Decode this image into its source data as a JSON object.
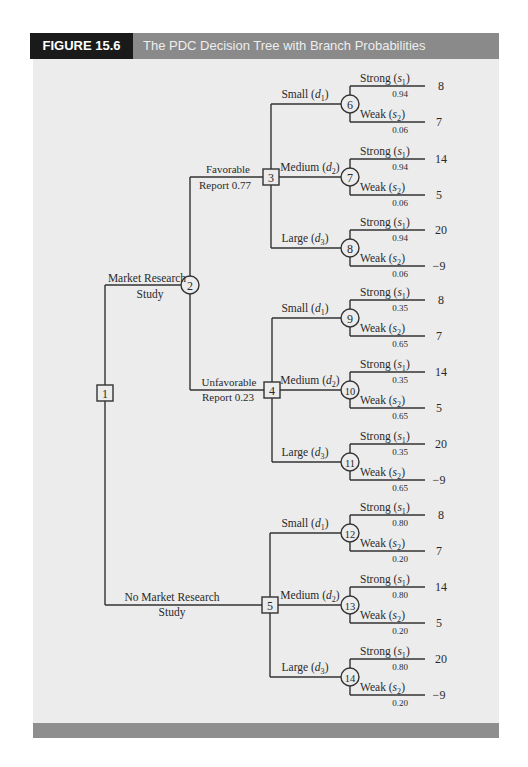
{
  "figure": {
    "label": "FIGURE 15.6",
    "title": "The PDC Decision Tree with Branch Probabilities"
  },
  "colors": {
    "label_bg": "#1a1a1a",
    "title_bg": "#8a8a8a",
    "panel_bg": "#ececec",
    "footer_bg": "#8e8e8e",
    "line": "#333333"
  },
  "tree": {
    "root": {
      "id": "1",
      "type": "decision"
    },
    "first_branches": [
      {
        "label_line1": "Market Research",
        "label_line2": "Study",
        "node": "2",
        "node_type": "chance"
      },
      {
        "label_line1": "No Market Research",
        "label_line2": "Study",
        "node": "5",
        "node_type": "decision"
      }
    ],
    "reports": [
      {
        "label_line1": "Favorable",
        "label_line2": "Report 0.77",
        "node": "3"
      },
      {
        "label_line1": "Unfavorable",
        "label_line2": "Report 0.23",
        "node": "4"
      }
    ],
    "decision_groups": [
      {
        "decision_node": "3",
        "alternatives": [
          {
            "label": "Small (d1)",
            "chance_node": "6",
            "strong_p": "0.94",
            "weak_p": "0.06",
            "payoffs": [
              "8",
              "7"
            ]
          },
          {
            "label": "Medium (d2)",
            "chance_node": "7",
            "strong_p": "0.94",
            "weak_p": "0.06",
            "payoffs": [
              "14",
              "5"
            ]
          },
          {
            "label": "Large (d3)",
            "chance_node": "8",
            "strong_p": "0.94",
            "weak_p": "0.06",
            "payoffs": [
              "20",
              "−9"
            ]
          }
        ]
      },
      {
        "decision_node": "4",
        "alternatives": [
          {
            "label": "Small (d1)",
            "chance_node": "9",
            "strong_p": "0.35",
            "weak_p": "0.65",
            "payoffs": [
              "8",
              "7"
            ]
          },
          {
            "label": "Medium (d2)",
            "chance_node": "10",
            "strong_p": "0.35",
            "weak_p": "0.65",
            "payoffs": [
              "14",
              "5"
            ]
          },
          {
            "label": "Large (d3)",
            "chance_node": "11",
            "strong_p": "0.35",
            "weak_p": "0.65",
            "payoffs": [
              "20",
              "−9"
            ]
          }
        ]
      },
      {
        "decision_node": "5",
        "alternatives": [
          {
            "label": "Small (d1)",
            "chance_node": "12",
            "strong_p": "0.80",
            "weak_p": "0.20",
            "payoffs": [
              "8",
              "7"
            ]
          },
          {
            "label": "Medium (d2)",
            "chance_node": "13",
            "strong_p": "0.80",
            "weak_p": "0.20",
            "payoffs": [
              "14",
              "5"
            ]
          },
          {
            "label": "Large (d3)",
            "chance_node": "14",
            "strong_p": "0.80",
            "weak_p": "0.20",
            "payoffs": [
              "20",
              "−9"
            ]
          }
        ]
      }
    ],
    "state_labels": {
      "strong": "Strong",
      "weak": "Weak",
      "s1": "s",
      "s1_sub": "1",
      "s2": "s",
      "s2_sub": "2"
    },
    "decision_labels": {
      "small": "Small",
      "medium": "Medium",
      "large": "Large",
      "d": "d",
      "sub1": "1",
      "sub2": "2",
      "sub3": "3"
    }
  }
}
